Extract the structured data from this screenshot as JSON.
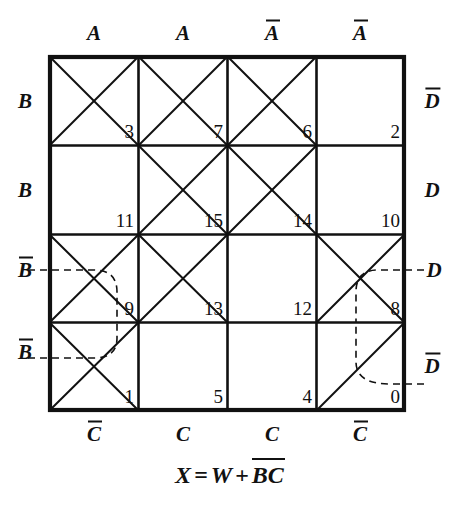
{
  "diagram": {
    "type": "veitch-karnaugh-map",
    "title_equation": {
      "lhs": "X",
      "equals": "=",
      "term1": "W",
      "plus": "+",
      "term2_var1": "B",
      "term2_var1_complement": true,
      "term2_var2": "C",
      "term2_var2_complement": true,
      "plain": "X = W + B̄C̄"
    },
    "grid": {
      "rows": 4,
      "cols": 4,
      "x0": 50,
      "y0": 57,
      "x1": 404,
      "y1": 410
    },
    "labels": {
      "top": [
        {
          "text": "A",
          "bar": false
        },
        {
          "text": "A",
          "bar": false
        },
        {
          "text": "A",
          "bar": true
        },
        {
          "text": "A",
          "bar": true
        }
      ],
      "bottom": [
        {
          "text": "C",
          "bar": true
        },
        {
          "text": "C",
          "bar": false
        },
        {
          "text": "C",
          "bar": false
        },
        {
          "text": "C",
          "bar": true
        }
      ],
      "left": [
        {
          "text": "B",
          "bar": false
        },
        {
          "text": "B",
          "bar": false
        },
        {
          "text": "B",
          "bar": true
        },
        {
          "text": "B",
          "bar": true
        }
      ],
      "right": [
        {
          "text": "D",
          "bar": true
        },
        {
          "text": "D",
          "bar": false
        },
        {
          "text": "D",
          "bar": false
        },
        {
          "text": "D",
          "bar": true
        }
      ]
    },
    "cells": [
      {
        "n": "3",
        "row": 0,
        "col": 0,
        "mark": "x"
      },
      {
        "n": "7",
        "row": 0,
        "col": 1,
        "mark": "x"
      },
      {
        "n": "6",
        "row": 0,
        "col": 2,
        "mark": "x"
      },
      {
        "n": "2",
        "row": 0,
        "col": 3,
        "mark": "none"
      },
      {
        "n": "11",
        "row": 1,
        "col": 0,
        "mark": "none"
      },
      {
        "n": "15",
        "row": 1,
        "col": 1,
        "mark": "x"
      },
      {
        "n": "14",
        "row": 1,
        "col": 2,
        "mark": "x"
      },
      {
        "n": "10",
        "row": 1,
        "col": 3,
        "mark": "none"
      },
      {
        "n": "9",
        "row": 2,
        "col": 0,
        "mark": "x"
      },
      {
        "n": "13",
        "row": 2,
        "col": 1,
        "mark": "x"
      },
      {
        "n": "12",
        "row": 2,
        "col": 2,
        "mark": "none"
      },
      {
        "n": "8",
        "row": 2,
        "col": 3,
        "mark": "x"
      },
      {
        "n": "1",
        "row": 3,
        "col": 0,
        "mark": "x"
      },
      {
        "n": "5",
        "row": 3,
        "col": 1,
        "mark": "none"
      },
      {
        "n": "4",
        "row": 3,
        "col": 2,
        "mark": "none"
      },
      {
        "n": "0",
        "row": 3,
        "col": 3,
        "mark": "slash"
      }
    ],
    "overlays": {
      "dashed_left_bbar": "dashed bracket from B-bar label rows 3-4 left edge into column 1",
      "dashed_right_d": "dashed bracket from D label row 3 right edge",
      "dashed_right_dbar": "dashed bracket from D-bar label row 4 right edge"
    }
  }
}
